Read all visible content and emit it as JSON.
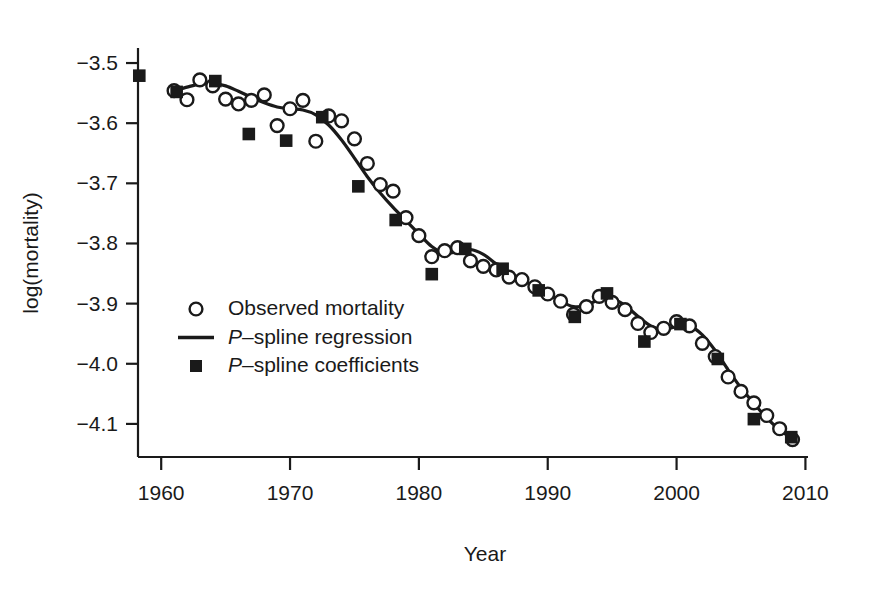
{
  "chart_data": {
    "type": "scatter",
    "title": "",
    "xlabel": "Year",
    "ylabel": "log(mortality)",
    "xlim": [
      1958.2,
      2010.2
    ],
    "ylim": [
      -4.155,
      -3.475
    ],
    "grid": false,
    "legend_position": "inside-left-middle",
    "xticks": [
      1960,
      1970,
      1980,
      1990,
      2000,
      2010
    ],
    "xtick_labels": [
      "1960",
      "1970",
      "1980",
      "1990",
      "2000",
      "2010"
    ],
    "yticks": [
      -3.5,
      -3.6,
      -3.7,
      -3.8,
      -3.9,
      -4.0,
      -4.1
    ],
    "ytick_labels": [
      "−3.5",
      "−3.6",
      "−3.7",
      "−3.8",
      "−3.9",
      "−4.0",
      "−4.1"
    ],
    "series": [
      {
        "name": "Observed mortality",
        "marker": "open-circle",
        "x": [
          1961,
          1962,
          1963,
          1964,
          1965,
          1966,
          1967,
          1968,
          1969,
          1970,
          1971,
          1972,
          1973,
          1974,
          1975,
          1976,
          1977,
          1978,
          1979,
          1980,
          1981,
          1982,
          1983,
          1984,
          1985,
          1986,
          1987,
          1988,
          1989,
          1990,
          1991,
          1992,
          1993,
          1994,
          1995,
          1996,
          1997,
          1998,
          1999,
          2000,
          2001,
          2002,
          2003,
          2004,
          2005,
          2006,
          2007,
          2008,
          2009
        ],
        "y": [
          -3.546,
          -3.561,
          -3.528,
          -3.538,
          -3.56,
          -3.568,
          -3.562,
          -3.553,
          -3.604,
          -3.576,
          -3.562,
          -3.63,
          -3.588,
          -3.596,
          -3.626,
          -3.667,
          -3.702,
          -3.713,
          -3.757,
          -3.787,
          -3.822,
          -3.812,
          -3.807,
          -3.829,
          -3.838,
          -3.844,
          -3.856,
          -3.86,
          -3.872,
          -3.884,
          -3.896,
          -3.918,
          -3.905,
          -3.888,
          -3.898,
          -3.91,
          -3.933,
          -3.948,
          -3.941,
          -3.93,
          -3.937,
          -3.966,
          -3.988,
          -4.022,
          -4.046,
          -4.065,
          -4.086,
          -4.108,
          -4.126
        ]
      }
    ],
    "spline_regression": {
      "name": "P–spline regression",
      "x": [
        1961.0,
        1962.0,
        1963.0,
        1964.0,
        1965.0,
        1966.0,
        1967.0,
        1968.0,
        1969.0,
        1970.0,
        1971.0,
        1972.0,
        1973.0,
        1974.0,
        1975.0,
        1976.0,
        1977.0,
        1978.0,
        1979.0,
        1980.0,
        1981.0,
        1982.0,
        1983.0,
        1984.0,
        1985.0,
        1986.0,
        1987.0,
        1988.0,
        1989.0,
        1990.0,
        1991.0,
        1992.0,
        1993.0,
        1994.0,
        1995.0,
        1996.0,
        1997.0,
        1998.0,
        1999.0,
        2000.0,
        2001.0,
        2002.0,
        2003.0,
        2004.0,
        2005.0,
        2006.0,
        2007.0,
        2008.0,
        2009.0
      ],
      "y": [
        -3.546,
        -3.54,
        -3.535,
        -3.534,
        -3.538,
        -3.547,
        -3.557,
        -3.566,
        -3.573,
        -3.576,
        -3.578,
        -3.586,
        -3.603,
        -3.628,
        -3.658,
        -3.689,
        -3.716,
        -3.74,
        -3.762,
        -3.784,
        -3.805,
        -3.816,
        -3.814,
        -3.81,
        -3.818,
        -3.834,
        -3.848,
        -3.86,
        -3.872,
        -3.884,
        -3.896,
        -3.905,
        -3.903,
        -3.893,
        -3.892,
        -3.903,
        -3.921,
        -3.937,
        -3.943,
        -3.938,
        -3.937,
        -3.952,
        -3.978,
        -4.01,
        -4.04,
        -4.066,
        -4.09,
        -4.11,
        -4.124
      ]
    },
    "spline_coefficients": {
      "name": "P–spline coefficients",
      "marker": "filled-square",
      "x": [
        1958.3,
        1961.2,
        1964.2,
        1966.8,
        1969.7,
        1972.5,
        1975.3,
        1978.2,
        1981.0,
        1983.6,
        1986.5,
        1989.3,
        1992.1,
        1994.6,
        1997.5,
        2000.3,
        2003.2,
        2006.0,
        2008.9
      ],
      "y": [
        -3.521,
        -3.548,
        -3.53,
        -3.618,
        -3.629,
        -3.59,
        -3.705,
        -3.761,
        -3.851,
        -3.809,
        -3.842,
        -3.878,
        -3.922,
        -3.883,
        -3.963,
        -3.934,
        -3.992,
        -4.092,
        -4.122
      ]
    },
    "legend_entries": [
      {
        "marker": "open-circle",
        "label": "Observed mortality",
        "italic_prefix": ""
      },
      {
        "marker": "line",
        "label": "–spline regression",
        "italic_prefix": "P"
      },
      {
        "marker": "filled-square",
        "label": "–spline coefficients",
        "italic_prefix": "P"
      }
    ],
    "colors": {
      "axis": "#1a1a1a",
      "line": "#1a1a1a",
      "marker_fill": "#1a1a1a",
      "marker_open": "#ffffff",
      "background": "#ffffff"
    }
  }
}
